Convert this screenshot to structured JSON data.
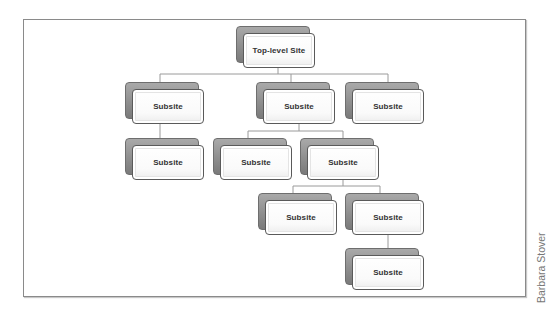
{
  "diagram": {
    "type": "site-hierarchy",
    "root": {
      "label": "Top-level Site"
    },
    "nodes": [
      {
        "id": "root",
        "label": "Top-level Site",
        "parent": null
      },
      {
        "id": "s1",
        "label": "Subsite",
        "parent": "root"
      },
      {
        "id": "s2",
        "label": "Subsite",
        "parent": "root"
      },
      {
        "id": "s3",
        "label": "Subsite",
        "parent": "root"
      },
      {
        "id": "s1a",
        "label": "Subsite",
        "parent": "s1"
      },
      {
        "id": "s2a",
        "label": "Subsite",
        "parent": "s2"
      },
      {
        "id": "s2b",
        "label": "Subsite",
        "parent": "s2"
      },
      {
        "id": "s2b1",
        "label": "Subsite",
        "parent": "s2b"
      },
      {
        "id": "s2b2",
        "label": "Subsite",
        "parent": "s2b"
      },
      {
        "id": "s2b2a",
        "label": "Subsite",
        "parent": "s2b2"
      }
    ]
  },
  "credit": "Barbara Stover",
  "colors": {
    "frame_border": "#8a8a8a",
    "node_shadow": "#8c8c8c",
    "node_face": "#ffffff",
    "connector": "#9a9a9a",
    "text": "#333333"
  }
}
